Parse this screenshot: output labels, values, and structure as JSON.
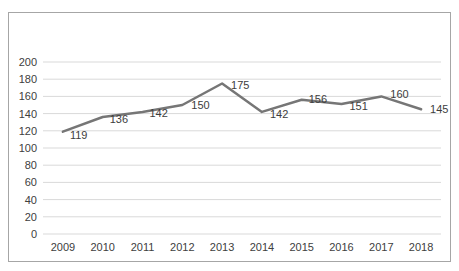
{
  "chart_data": {
    "type": "line",
    "title": "",
    "xlabel": "",
    "ylabel": "",
    "categories": [
      "2009",
      "2010",
      "2011",
      "2012",
      "2013",
      "2014",
      "2015",
      "2016",
      "2017",
      "2018"
    ],
    "series": [
      {
        "name": "",
        "values": [
          119,
          136,
          142,
          150,
          175,
          142,
          156,
          151,
          160,
          145
        ],
        "color": "#767676"
      }
    ],
    "data_labels": [
      "119",
      "136",
      "142",
      "150",
      "175",
      "142",
      "156",
      "151",
      "160",
      "145"
    ],
    "ylim": [
      0,
      200
    ],
    "ytick_step": 20,
    "ytick_labels": [
      "0",
      "20",
      "40",
      "60",
      "80",
      "100",
      "120",
      "140",
      "160",
      "180",
      "200"
    ],
    "grid": true,
    "legend": false,
    "colors": {
      "line": "#767676",
      "gridline": "#d9d9d9",
      "tick_label": "#404040",
      "data_label": "#3d3d3d",
      "frame_border": "#a6a6a6",
      "background": "#ffffff"
    }
  }
}
